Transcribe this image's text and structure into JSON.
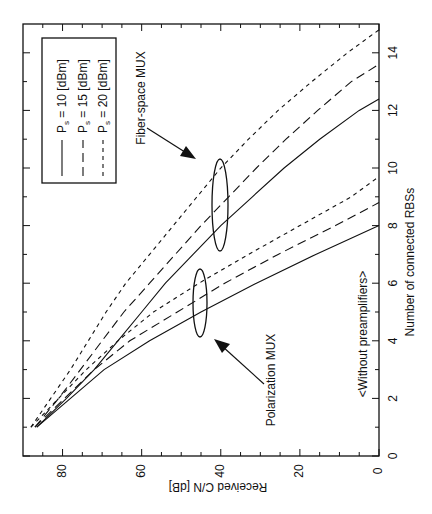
{
  "chart_data": {
    "type": "line",
    "orientation": "rotated-90-ccw",
    "title": "",
    "xlabel": "Number of connected RBSs",
    "ylabel": "Received C/N [dB]",
    "xlim": [
      0,
      15
    ],
    "ylim": [
      0,
      90
    ],
    "xticks": [
      0,
      2,
      4,
      6,
      8,
      10,
      12,
      14
    ],
    "xminor_ticks": [
      1,
      3,
      5,
      7,
      9,
      11,
      13
    ],
    "yticks": [
      0,
      20,
      40,
      60,
      80
    ],
    "yminor_ticks": [
      5,
      10,
      15,
      25,
      30,
      35,
      45,
      50,
      55,
      65,
      70,
      75,
      85
    ],
    "grid": false,
    "legend": {
      "position": "upper-left",
      "entries": [
        {
          "label_main": "P",
          "label_sub": "s",
          "label_rest": " = 10 [dBm]",
          "style": "solid"
        },
        {
          "label_main": "P",
          "label_sub": "s",
          "label_rest": " = 15 [dBm]",
          "style": "long-dash"
        },
        {
          "label_main": "P",
          "label_sub": "s",
          "label_rest": " = 20 [dBm]",
          "style": "short-dash"
        }
      ]
    },
    "annotations": {
      "fiber": "Fiber-space MUX",
      "polarization": "Polarization MUX",
      "note": "<Without preamplifiers>"
    },
    "series": [
      {
        "name": "Fiber-space MUX, Ps = 10 dBm",
        "style": "solid",
        "x": [
          1,
          2,
          3,
          4,
          5,
          6,
          7,
          8,
          9,
          10,
          11,
          12,
          12.4
        ],
        "y": [
          86.5,
          79,
          72,
          66,
          60,
          54,
          47,
          40,
          32,
          24,
          15,
          5,
          0
        ]
      },
      {
        "name": "Fiber-space MUX, Ps = 15 dBm",
        "style": "long-dash",
        "x": [
          1,
          2,
          3,
          4,
          5,
          6,
          7,
          8,
          9,
          10,
          11,
          12,
          13,
          13.6
        ],
        "y": [
          87,
          81,
          75.5,
          70,
          64.5,
          58,
          51.5,
          45,
          38,
          31,
          23.5,
          15.5,
          7,
          0
        ]
      },
      {
        "name": "Fiber-space MUX, Ps = 20 dBm",
        "style": "short-dash",
        "x": [
          1,
          2,
          3,
          4,
          5,
          6,
          7,
          8,
          9,
          10,
          11,
          12,
          13,
          14,
          14.8
        ],
        "y": [
          88,
          83,
          78,
          73.5,
          69,
          64,
          58,
          52,
          46,
          40,
          33,
          25.5,
          17,
          8,
          0
        ]
      },
      {
        "name": "Polarization MUX, Ps = 10 dBm",
        "style": "solid",
        "x": [
          1,
          2,
          3,
          4,
          5,
          6,
          7,
          8
        ],
        "y": [
          86.5,
          78,
          69.5,
          58,
          45,
          31,
          16,
          0
        ]
      },
      {
        "name": "Polarization MUX, Ps = 15 dBm",
        "style": "long-dash",
        "x": [
          1,
          2,
          3,
          4,
          5,
          6,
          7,
          8,
          8.8
        ],
        "y": [
          87,
          79.5,
          72,
          63,
          51,
          39,
          25.5,
          11,
          0
        ]
      },
      {
        "name": "Polarization MUX, Ps = 20 dBm",
        "style": "short-dash",
        "x": [
          1,
          2,
          3,
          4,
          5,
          6,
          7,
          8,
          9,
          9.7
        ],
        "y": [
          88,
          81,
          74,
          66,
          57,
          45.5,
          33,
          20,
          7,
          0
        ]
      }
    ]
  }
}
